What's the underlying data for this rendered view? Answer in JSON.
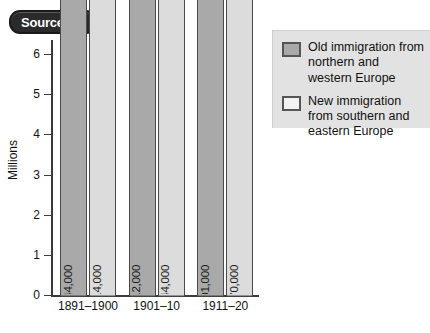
{
  "source_badge": {
    "word": "Source",
    "letter": "B"
  },
  "legend": {
    "items": [
      {
        "swatch": "old",
        "label": "Old immigration from northern and western Europe"
      },
      {
        "swatch": "new",
        "label": "New immigration from southern and eastern Europe"
      }
    ]
  },
  "chart_data": {
    "type": "bar",
    "title": "",
    "xlabel": "",
    "ylabel": "Millions",
    "ylim": [
      0,
      6.35
    ],
    "yticks": [
      0,
      1,
      2,
      3,
      4,
      5,
      6
    ],
    "ytick_labels": [
      "0",
      "1",
      "2",
      "3",
      "4",
      "5",
      "6"
    ],
    "grid": false,
    "legend_position": "right",
    "categories": [
      "1891–1900",
      "1901–10",
      "1911–20"
    ],
    "series": [
      {
        "name": "Old immigration from northern and western Europe",
        "color": "#a9a9a9",
        "values": [
          1644000,
          1912000,
          2001000
        ],
        "labels": [
          "1,644,000",
          "1,912,000",
          "2,001,000"
        ]
      },
      {
        "name": "New immigration from southern and eastern Europe",
        "color": "#dcdcdc",
        "values": [
          1914000,
          6244000,
          2370000
        ],
        "labels": [
          "1,914,000",
          "6,244,000",
          "2,370,000"
        ]
      }
    ]
  },
  "colors": {
    "old_bar": "#a9a9a9",
    "new_bar": "#dcdcdc",
    "legend_bg": "#e2e2e2",
    "badge_bg": "#2b2b2b",
    "axis": "#3a3a3a"
  }
}
